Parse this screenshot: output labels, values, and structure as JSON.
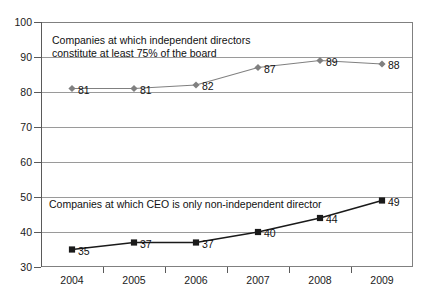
{
  "chart_data": {
    "type": "line",
    "title": "",
    "xlabel": "",
    "ylabel": "",
    "categories": [
      "2004",
      "2005",
      "2006",
      "2007",
      "2008",
      "2009"
    ],
    "ylim": [
      30,
      100
    ],
    "yticks": [
      30,
      40,
      50,
      60,
      70,
      80,
      90,
      100
    ],
    "ytick_labels": [
      "30",
      "40",
      "50",
      "60",
      "70",
      "80",
      "90",
      "100"
    ],
    "grid": true,
    "legend_position": "inline-annotation",
    "series": [
      {
        "name": "Companies at which independent directors constitute at least 75% of the board",
        "marker": "diamond",
        "color": "#808080",
        "line_color": "#808080",
        "values": [
          81,
          81,
          82,
          87,
          89,
          88
        ],
        "value_labels": [
          "81",
          "81",
          "82",
          "87",
          "89",
          "88"
        ]
      },
      {
        "name": "Companies at which CEO is only non-independent director",
        "marker": "square",
        "color": "#1a1a1a",
        "line_color": "#1a1a1a",
        "values": [
          35,
          37,
          37,
          40,
          44,
          49
        ],
        "value_labels": [
          "35",
          "37",
          "37",
          "40",
          "44",
          "49"
        ]
      }
    ],
    "annotations": [
      {
        "id": "note-upper",
        "text": "Companies at which independent directors\nconstitute at least 75% of the board"
      },
      {
        "id": "note-lower",
        "text": "Companies at which CEO is only non-independent director"
      }
    ]
  },
  "ghost_title": ""
}
